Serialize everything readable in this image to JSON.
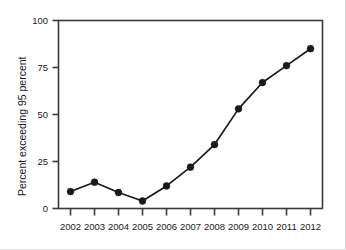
{
  "chart_data": {
    "type": "line",
    "title": "",
    "subtitle": "",
    "xlabel": "",
    "ylabel": "Percent exceeding 95 percent",
    "categories": [
      "2002",
      "2003",
      "2004",
      "2005",
      "2006",
      "2007",
      "2008",
      "2009",
      "2010",
      "2011",
      "2012"
    ],
    "x": [
      2002,
      2003,
      2004,
      2005,
      2006,
      2007,
      2008,
      2009,
      2010,
      2011,
      2012
    ],
    "values": [
      9,
      14,
      8.5,
      4,
      12,
      22,
      34,
      53,
      67,
      76,
      85
    ],
    "series": [
      {
        "name": "Percent exceeding 95 percent",
        "values": [
          9,
          14,
          8.5,
          4,
          12,
          22,
          34,
          53,
          67,
          76,
          85
        ]
      }
    ],
    "ylim": [
      0,
      100
    ],
    "yticks": [
      0,
      25,
      50,
      75,
      100
    ],
    "ytick_labels": [
      "0",
      "25",
      "50",
      "75",
      "100"
    ],
    "xtick_labels": [
      "2002",
      "2003",
      "2004",
      "2005",
      "2006",
      "2007",
      "2008",
      "2009",
      "2010",
      "2011",
      "2012"
    ],
    "grid": false,
    "legend": false,
    "legend_position": "none",
    "marker": "filled-circle",
    "line_color": "#1a1a1a",
    "marker_color": "#1a1a1a",
    "axis_color": "#3a3a3a",
    "background_color": "#ffffff"
  },
  "axes": {
    "y_title": "Percent exceeding 95 percent",
    "y_ticks": [
      {
        "label": "100",
        "value": 100
      },
      {
        "label": "75",
        "value": 75
      },
      {
        "label": "50",
        "value": 50
      },
      {
        "label": "25",
        "value": 25
      },
      {
        "label": "0",
        "value": 0
      }
    ],
    "x_ticks": [
      {
        "label": "2002",
        "value": 2002
      },
      {
        "label": "2003",
        "value": 2003
      },
      {
        "label": "2004",
        "value": 2004
      },
      {
        "label": "2005",
        "value": 2005
      },
      {
        "label": "2006",
        "value": 2006
      },
      {
        "label": "2007",
        "value": 2007
      },
      {
        "label": "2008",
        "value": 2008
      },
      {
        "label": "2009",
        "value": 2009
      },
      {
        "label": "2010",
        "value": 2010
      },
      {
        "label": "2011",
        "value": 2011
      },
      {
        "label": "2012",
        "value": 2012
      }
    ]
  }
}
